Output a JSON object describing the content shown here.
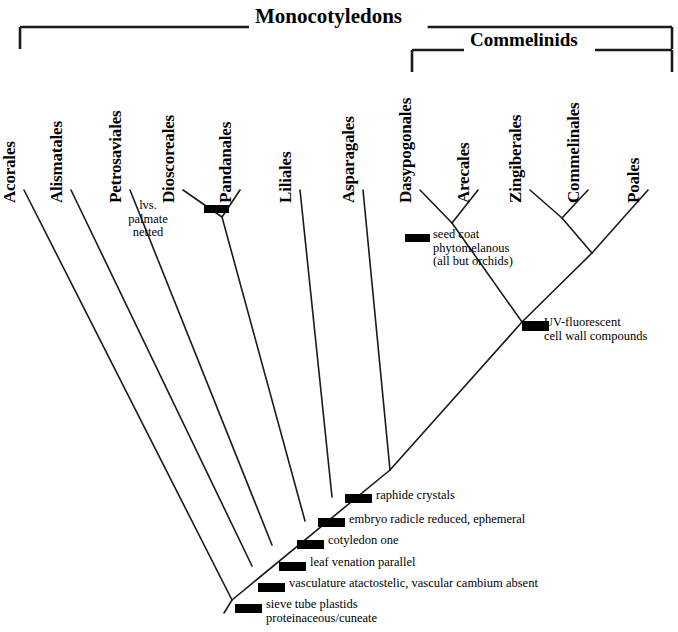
{
  "figure": {
    "type": "cladogram"
  },
  "clade_brackets": [
    {
      "label": "Monocotyledons",
      "x1": 20,
      "x2": 672,
      "y": 27,
      "label_x": 255,
      "label_y": 4,
      "font_size": 21
    },
    {
      "label": "Commelinids",
      "x1": 412,
      "x2": 672,
      "y": 50,
      "label_x": 470,
      "label_y": 29,
      "font_size": 19
    }
  ],
  "taxa": [
    {
      "name": "Acorales",
      "x": 24,
      "tip_y": 190,
      "label_y": 183
    },
    {
      "name": "Alismatales",
      "x": 71,
      "tip_y": 190,
      "label_y": 183
    },
    {
      "name": "Petrosaviales",
      "x": 130,
      "tip_y": 190,
      "label_y": 183
    },
    {
      "name": "Dioscoreales",
      "x": 183,
      "tip_y": 190,
      "label_y": 183
    },
    {
      "name": "Pandanales",
      "x": 240,
      "tip_y": 190,
      "label_y": 183
    },
    {
      "name": "Liliales",
      "x": 300,
      "tip_y": 190,
      "label_y": 183
    },
    {
      "name": "Asparagales",
      "x": 363,
      "tip_y": 190,
      "label_y": 183
    },
    {
      "name": "Dasypogonales",
      "x": 420,
      "tip_y": 190,
      "label_y": 183
    },
    {
      "name": "Arecales",
      "x": 478,
      "tip_y": 190,
      "label_y": 183
    },
    {
      "name": "Zingiberales",
      "x": 530,
      "tip_y": 190,
      "label_y": 183
    },
    {
      "name": "Commelinales",
      "x": 588,
      "tip_y": 190,
      "label_y": 183
    },
    {
      "name": "Poales",
      "x": 648,
      "tip_y": 190,
      "label_y": 183
    }
  ],
  "branches": [
    {
      "id": "acorales-branch",
      "x1": 24,
      "y1": 190,
      "x2": 232,
      "y2": 600
    },
    {
      "id": "alismatales-branch",
      "x1": 71,
      "y1": 190,
      "x2": 252,
      "y2": 566
    },
    {
      "id": "petrosaviales-branch",
      "x1": 130,
      "y1": 190,
      "x2": 272,
      "y2": 545
    },
    {
      "id": "dioscoreales-branch",
      "x1": 183,
      "y1": 190,
      "x2": 222,
      "y2": 217
    },
    {
      "id": "pandanales-branch",
      "x1": 240,
      "y1": 190,
      "x2": 222,
      "y2": 217
    },
    {
      "id": "dioscoreales-pandanales-stem",
      "x1": 222,
      "y1": 217,
      "x2": 305,
      "y2": 521
    },
    {
      "id": "liliales-branch",
      "x1": 300,
      "y1": 190,
      "x2": 332,
      "y2": 497
    },
    {
      "id": "asparagales-branch",
      "x1": 363,
      "y1": 190,
      "x2": 390,
      "y2": 470
    },
    {
      "id": "dasypogonales-branch",
      "x1": 420,
      "y1": 190,
      "x2": 452,
      "y2": 223
    },
    {
      "id": "arecales-branch",
      "x1": 478,
      "y1": 190,
      "x2": 452,
      "y2": 223
    },
    {
      "id": "dasypogonales-arecales-stem",
      "x1": 452,
      "y1": 223,
      "x2": 522,
      "y2": 322
    },
    {
      "id": "zingiberales-branch",
      "x1": 530,
      "y1": 190,
      "x2": 562,
      "y2": 218
    },
    {
      "id": "commelinales-branch",
      "x1": 588,
      "y1": 190,
      "x2": 562,
      "y2": 218
    },
    {
      "id": "zingiberales-commelinales-stem",
      "x1": 562,
      "y1": 218,
      "x2": 592,
      "y2": 253
    },
    {
      "id": "poales-branch",
      "x1": 648,
      "y1": 190,
      "x2": 592,
      "y2": 253
    },
    {
      "id": "commelinid-stem",
      "x1": 592,
      "y1": 253,
      "x2": 522,
      "y2": 322
    },
    {
      "id": "commelinid-to-backbone",
      "x1": 522,
      "y1": 322,
      "x2": 390,
      "y2": 470
    },
    {
      "id": "backbone-upper",
      "x1": 390,
      "y1": 470,
      "x2": 232,
      "y2": 600
    },
    {
      "id": "backbone-root",
      "x1": 232,
      "y1": 600,
      "x2": 224,
      "y2": 613
    }
  ],
  "synapomorphy_bars": [
    {
      "id": "lvs-palmate-netted",
      "x": 204,
      "y": 205,
      "w": 25,
      "h": 8,
      "angle": 0
    },
    {
      "id": "seed-coat",
      "x": 405,
      "y": 234,
      "w": 25,
      "h": 8,
      "angle": 0
    },
    {
      "id": "uv-fluorescent",
      "x": 522,
      "y": 321,
      "w": 27,
      "h": 10,
      "angle": 0
    },
    {
      "id": "raphide-crystals",
      "x": 345,
      "y": 494,
      "w": 27,
      "h": 9,
      "angle": 0
    },
    {
      "id": "embryo-radicle",
      "x": 318,
      "y": 518,
      "w": 27,
      "h": 9,
      "angle": 0
    },
    {
      "id": "cotyledon-one",
      "x": 297,
      "y": 540,
      "w": 27,
      "h": 9,
      "angle": 0
    },
    {
      "id": "leaf-venation",
      "x": 279,
      "y": 562,
      "w": 27,
      "h": 9,
      "angle": 0
    },
    {
      "id": "vasculature",
      "x": 258,
      "y": 583,
      "w": 27,
      "h": 9,
      "angle": 0
    },
    {
      "id": "sieve-tube-plastids",
      "x": 235,
      "y": 604,
      "w": 27,
      "h": 9,
      "angle": 0
    }
  ],
  "annotations": [
    {
      "id": "lvs-palmate-netted",
      "text": "lvs.\npalmate\nnetted",
      "x": 148,
      "y": 199,
      "align": "center"
    },
    {
      "id": "seed-coat",
      "text": "seed coat\nphytomelanous\n(all but orchids)",
      "x": 433,
      "y": 228,
      "align": "left"
    },
    {
      "id": "uv-fluorescent",
      "text": "UV-fluorescent\ncell wall compounds",
      "x": 544,
      "y": 316,
      "align": "left"
    },
    {
      "id": "raphide-crystals",
      "text": "raphide crystals",
      "x": 376,
      "y": 489,
      "align": "left"
    },
    {
      "id": "embryo-radicle",
      "text": "embryo radicle reduced, ephemeral",
      "x": 349,
      "y": 513,
      "align": "left"
    },
    {
      "id": "cotyledon-one",
      "text": "cotyledon one",
      "x": 328,
      "y": 534,
      "align": "left"
    },
    {
      "id": "leaf-venation",
      "text": "leaf venation parallel",
      "x": 310,
      "y": 556,
      "align": "left"
    },
    {
      "id": "vasculature",
      "text": "vasculature atactostelic, vascular cambium absent",
      "x": 289,
      "y": 577,
      "align": "left"
    },
    {
      "id": "sieve-tube-plastids",
      "text": "sieve tube plastids\nproteinaceous/cuneate",
      "x": 266,
      "y": 598,
      "align": "left"
    }
  ],
  "colors": {
    "line": "#1a1a1a",
    "bar": "#000000",
    "text": "#000000",
    "background": "#ffffff"
  }
}
